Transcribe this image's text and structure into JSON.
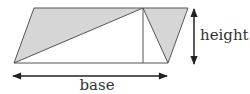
{
  "diagram": {
    "labels": {
      "height": "height",
      "base": "base"
    },
    "colors": {
      "shaded": "#d6d6d6",
      "stroke": "#555555",
      "arrow": "#222222",
      "text": "#333333"
    },
    "shapes": {
      "parallelogram": "34,8 188,8 168,63 14,63",
      "left_triangle": "34,8 143,8 14,63",
      "right_triangle": "143,8 188,8 168,63",
      "altitude_line": {
        "x": 143,
        "y1": 8,
        "y2": 63
      }
    },
    "arrows": {
      "height": {
        "x": 194,
        "y1": 8,
        "y2": 64
      },
      "base": {
        "y": 76,
        "x1": 12,
        "x2": 168
      }
    }
  }
}
